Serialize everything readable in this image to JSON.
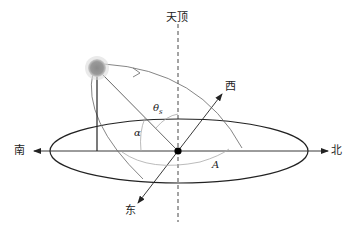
{
  "diagram": {
    "type": "solar-position-geometry",
    "labels": {
      "zenith": "天顶",
      "west": "西",
      "east": "东",
      "south": "南",
      "north": "北"
    },
    "angles": {
      "zenith_angle": "θ",
      "zenith_angle_subscript": "s",
      "altitude_angle": "α",
      "azimuth_angle": "A"
    },
    "colors": {
      "line": "#222222",
      "thin_line": "#555555",
      "arc": "#aaaaaa",
      "sun": "#8c8c8c",
      "sun_glow": "#bdbdbd"
    }
  }
}
